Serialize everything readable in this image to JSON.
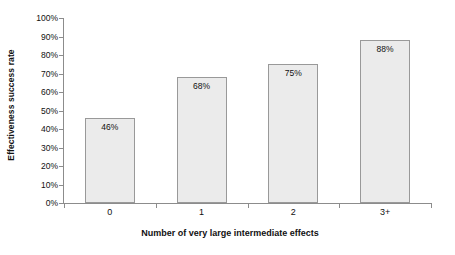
{
  "chart_data": {
    "type": "bar",
    "title": "",
    "subtitle": "",
    "categories": [
      "0",
      "1",
      "2",
      "3+"
    ],
    "values": [
      46,
      68,
      75,
      88
    ],
    "data_labels": [
      "46%",
      "68%",
      "75%",
      "88%"
    ],
    "xlabel": "Number of very large intermediate effects",
    "ylabel": "Effectiveness success rate",
    "ylim": [
      0,
      100
    ],
    "ytick_values": [
      0,
      10,
      20,
      30,
      40,
      50,
      60,
      70,
      80,
      90,
      100
    ],
    "ytick_labels": [
      "0%",
      "10%",
      "20%",
      "30%",
      "40%",
      "50%",
      "60%",
      "70%",
      "80%",
      "90%",
      "100%"
    ],
    "grid": false,
    "legend": false,
    "legend_position": "none",
    "series": [
      {
        "name": "Effectiveness success rate",
        "values": [
          46,
          68,
          75,
          88
        ]
      }
    ],
    "colors": {
      "bar_fill": "#ebebeb",
      "bar_border": "#999999",
      "axis": "#8c8c8c",
      "text": "#111111",
      "background": "#ffffff"
    }
  }
}
